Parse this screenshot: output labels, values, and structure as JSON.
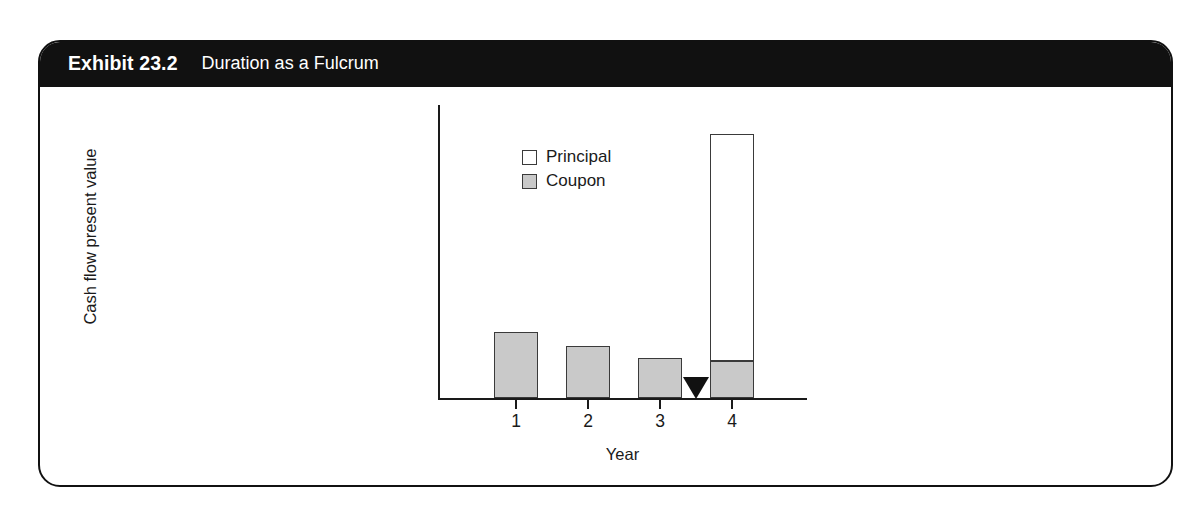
{
  "exhibit": {
    "number": "Exhibit 23.2",
    "title": "Duration as a Fulcrum"
  },
  "chart_data": {
    "type": "bar",
    "stacked": true,
    "title": "Duration as a Fulcrum",
    "xlabel": "Year",
    "ylabel": "Cash flow present value",
    "categories": [
      "1",
      "2",
      "3",
      "4"
    ],
    "series": [
      {
        "name": "Coupon",
        "values": [
          66,
          52,
          40,
          37
        ]
      },
      {
        "name": "Principal",
        "values": [
          0,
          0,
          0,
          227
        ]
      }
    ],
    "legend": [
      "Principal",
      "Coupon"
    ],
    "legend_position": "inside-top-left",
    "grid": false,
    "axis_tick_labels_y": [],
    "annotations": [
      {
        "type": "fulcrum-triangle",
        "label": "",
        "x_position": "between 3 and 4",
        "x_value": 3.5
      }
    ],
    "colors": {
      "coupon": "#c9c9c9",
      "principal": "#ffffff",
      "outline": "#3a3a3a",
      "axis": "#1a1a1a",
      "fulcrum": "#111111",
      "header_background": "#111111",
      "header_text": "#ffffff"
    }
  }
}
